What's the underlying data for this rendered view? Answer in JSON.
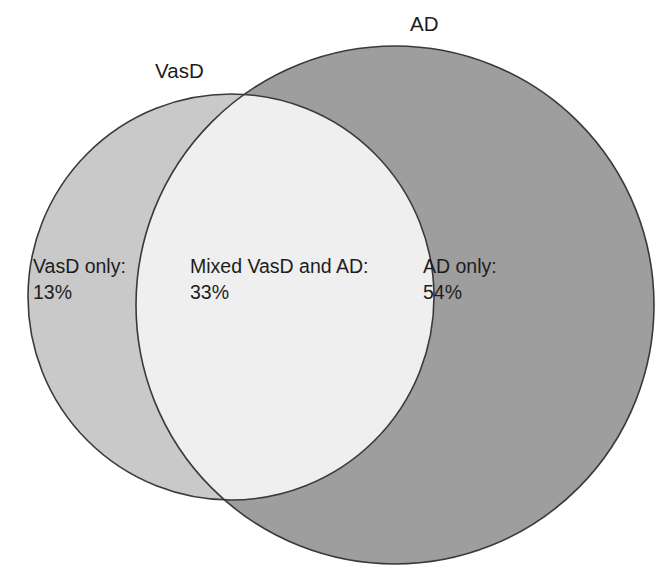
{
  "figure": {
    "type": "venn-diagram",
    "background_color": "#ffffff",
    "stroke_color": "#3a3a3a",
    "text_color": "#1d1d1d"
  },
  "sets": {
    "left": {
      "title": "VasD",
      "fill_color": "#c9c9c9",
      "center_x": 231,
      "center_y": 297,
      "radius": 203
    },
    "right": {
      "title": "AD",
      "fill_color": "#9e9e9e",
      "center_x": 395,
      "center_y": 305,
      "radius": 259
    },
    "overlap": {
      "fill_color": "#efefef"
    }
  },
  "regions": [
    {
      "key": "vasd_only",
      "caption": "VasD only:",
      "value": "13%",
      "percent": 13
    },
    {
      "key": "mixed",
      "caption": "Mixed VasD and AD:",
      "value": "33%",
      "percent": 33
    },
    {
      "key": "ad_only",
      "caption": "AD only:",
      "value": "54%",
      "percent": 54
    }
  ],
  "chart_data": {
    "type": "pie",
    "title": "",
    "categories": [
      "VasD only",
      "Mixed VasD and AD",
      "AD only"
    ],
    "values": [
      13,
      33,
      54
    ],
    "value_labels": [
      "13%",
      "33%",
      "54%"
    ],
    "units": "percent",
    "legend": [
      "VasD",
      "AD"
    ],
    "xlabel": "",
    "ylabel": "",
    "grid": false,
    "legend_position": "top"
  }
}
